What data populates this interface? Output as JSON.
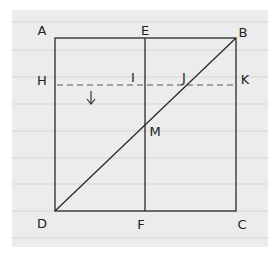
{
  "diagram": {
    "type": "geometry-square-construction",
    "paper_style": "ruled-notebook",
    "colors": {
      "paper": "#ececec",
      "rule": "#d6d6d6",
      "ink": "#2a2a2a",
      "background": "#ffffff"
    },
    "points": {
      "A": {
        "label": "A",
        "x": 55,
        "y": 38,
        "label_x": 42,
        "label_y": 30
      },
      "E": {
        "label": "E",
        "x": 145,
        "y": 38,
        "label_x": 145,
        "label_y": 30
      },
      "B": {
        "label": "B",
        "x": 236,
        "y": 38,
        "label_x": 243,
        "label_y": 32
      },
      "H": {
        "label": "H",
        "x": 55,
        "y": 85,
        "label_x": 42,
        "label_y": 80
      },
      "I": {
        "label": "I",
        "x": 145,
        "y": 85,
        "label_x": 133,
        "label_y": 77
      },
      "J": {
        "label": "J",
        "x": 192,
        "y": 85,
        "label_x": 184,
        "label_y": 77
      },
      "K": {
        "label": "K",
        "x": 236,
        "y": 85,
        "label_x": 245,
        "label_y": 79
      },
      "M": {
        "label": "M",
        "x": 145,
        "y": 124,
        "label_x": 155,
        "label_y": 131
      },
      "D": {
        "label": "D",
        "x": 55,
        "y": 211,
        "label_x": 42,
        "label_y": 223
      },
      "F": {
        "label": "F",
        "x": 145,
        "y": 211,
        "label_x": 141,
        "label_y": 224
      },
      "C": {
        "label": "C",
        "x": 236,
        "y": 211,
        "label_x": 242,
        "label_y": 224
      }
    },
    "segments": [
      {
        "name": "square-ABCD",
        "style": "solid"
      },
      {
        "name": "segment-EF",
        "from": "E",
        "to": "F",
        "style": "solid"
      },
      {
        "name": "diagonal-DB",
        "from": "D",
        "to": "B",
        "style": "solid"
      },
      {
        "name": "segment-HK",
        "from": "H",
        "to": "K",
        "style": "dashed"
      }
    ],
    "arrow": {
      "direction": "down",
      "x": 91,
      "y1": 91,
      "y2": 104
    }
  }
}
